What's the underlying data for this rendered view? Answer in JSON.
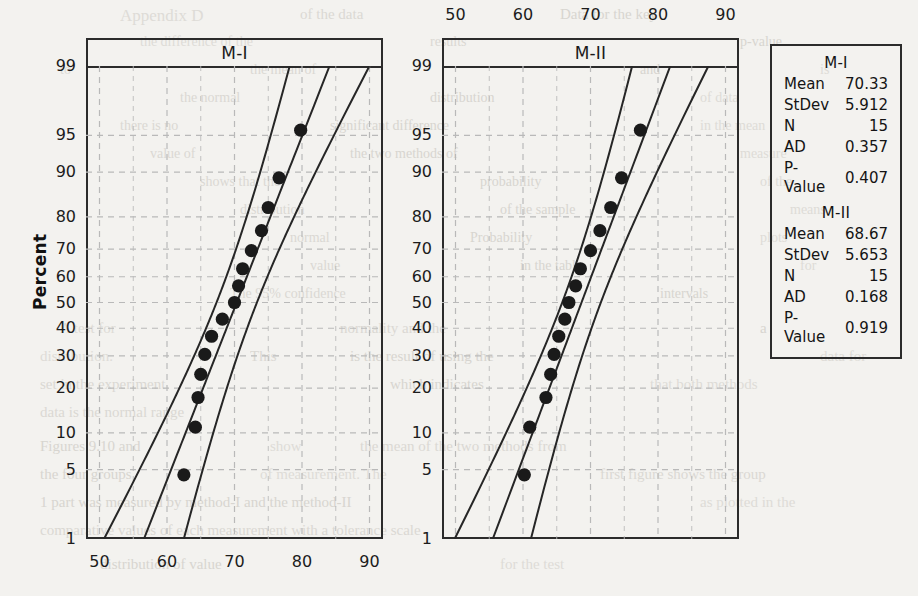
{
  "page": {
    "background_color": "#f3f2ef",
    "axis_color": "#2b2b2b",
    "grid_color": "#b9b9b9",
    "point_color": "#1a1a1a"
  },
  "axis": {
    "y_title": "Percent",
    "y_ticks": [
      "99",
      "95",
      "90",
      "80",
      "70",
      "60",
      "50",
      "40",
      "30",
      "20",
      "10",
      "5",
      "1"
    ],
    "x_ticks": [
      "50",
      "60",
      "70",
      "80",
      "90"
    ]
  },
  "panels": [
    {
      "id": "m1",
      "title": "M-I",
      "x_label_position": "bottom"
    },
    {
      "id": "m2",
      "title": "M-II",
      "x_label_position": "top"
    }
  ],
  "stats": {
    "groups": [
      {
        "name": "M-I",
        "rows": [
          {
            "label": "Mean",
            "value": "70.33"
          },
          {
            "label": "StDev",
            "value": "5.912"
          },
          {
            "label": "N",
            "value": "15"
          },
          {
            "label": "AD",
            "value": "0.357"
          },
          {
            "label": "P-Value",
            "value": "0.407"
          }
        ]
      },
      {
        "name": "M-II",
        "rows": [
          {
            "label": "Mean",
            "value": "68.67"
          },
          {
            "label": "StDev",
            "value": "5.653"
          },
          {
            "label": "N",
            "value": "15"
          },
          {
            "label": "AD",
            "value": "0.168"
          },
          {
            "label": "P-Value",
            "value": "0.919"
          }
        ]
      }
    ]
  },
  "chart_data": [
    {
      "type": "scatter",
      "title": "M-I",
      "subtitle": "Normal probability plot with 95% confidence bands",
      "xlabel": "",
      "ylabel": "Percent",
      "xlim": [
        48,
        92
      ],
      "ylim_percent": [
        1,
        99
      ],
      "grid": true,
      "x_ticks": [
        50,
        60,
        70,
        80,
        90
      ],
      "y_ticks_percent": [
        1,
        5,
        10,
        20,
        30,
        40,
        50,
        60,
        70,
        80,
        90,
        95,
        99
      ],
      "n": 15,
      "mean": 70.33,
      "stdev": 5.912,
      "ad": 0.357,
      "p_value": 0.407,
      "points": [
        {
          "x": 62.5,
          "percent": 4.5
        },
        {
          "x": 64.2,
          "percent": 11.0
        },
        {
          "x": 64.6,
          "percent": 17.5
        },
        {
          "x": 65.0,
          "percent": 24.0
        },
        {
          "x": 65.6,
          "percent": 30.5
        },
        {
          "x": 66.6,
          "percent": 37.0
        },
        {
          "x": 68.2,
          "percent": 43.5
        },
        {
          "x": 70.0,
          "percent": 50.0
        },
        {
          "x": 70.6,
          "percent": 56.5
        },
        {
          "x": 71.2,
          "percent": 63.0
        },
        {
          "x": 72.5,
          "percent": 69.5
        },
        {
          "x": 74.0,
          "percent": 76.0
        },
        {
          "x": 75.0,
          "percent": 82.5
        },
        {
          "x": 76.6,
          "percent": 89.0
        },
        {
          "x": 79.8,
          "percent": 95.5
        }
      ],
      "fit_line": {
        "slope_mean": 70.33,
        "stdev": 5.912
      },
      "confidence_bands": 95
    },
    {
      "type": "scatter",
      "title": "M-II",
      "subtitle": "Normal probability plot with 95% confidence bands",
      "xlabel": "",
      "ylabel": "Percent",
      "xlim": [
        48,
        92
      ],
      "ylim_percent": [
        1,
        99
      ],
      "grid": true,
      "x_ticks": [
        50,
        60,
        70,
        80,
        90
      ],
      "y_ticks_percent": [
        1,
        5,
        10,
        20,
        30,
        40,
        50,
        60,
        70,
        80,
        90,
        95,
        99
      ],
      "n": 15,
      "mean": 68.67,
      "stdev": 5.653,
      "ad": 0.168,
      "p_value": 0.919,
      "points": [
        {
          "x": 60.2,
          "percent": 4.5
        },
        {
          "x": 61.0,
          "percent": 11.0
        },
        {
          "x": 63.4,
          "percent": 17.5
        },
        {
          "x": 64.1,
          "percent": 24.0
        },
        {
          "x": 64.6,
          "percent": 30.5
        },
        {
          "x": 65.3,
          "percent": 37.0
        },
        {
          "x": 66.2,
          "percent": 43.5
        },
        {
          "x": 66.8,
          "percent": 50.0
        },
        {
          "x": 67.8,
          "percent": 56.5
        },
        {
          "x": 68.5,
          "percent": 63.0
        },
        {
          "x": 70.0,
          "percent": 69.5
        },
        {
          "x": 71.4,
          "percent": 76.0
        },
        {
          "x": 73.0,
          "percent": 82.5
        },
        {
          "x": 74.6,
          "percent": 89.0
        },
        {
          "x": 77.4,
          "percent": 95.5
        }
      ],
      "fit_line": {
        "slope_mean": 68.67,
        "stdev": 5.653
      },
      "confidence_bands": 95
    }
  ],
  "bleed_text": [
    {
      "t": "Appendix D",
      "x": 120,
      "y": 6,
      "s": 17
    },
    {
      "t": "of the data",
      "x": 300,
      "y": 6,
      "s": 15
    },
    {
      "t": "Data for the key",
      "x": 560,
      "y": 6,
      "s": 15
    },
    {
      "t": "the difference of the",
      "x": 140,
      "y": 34,
      "s": 14
    },
    {
      "t": "results",
      "x": 430,
      "y": 34,
      "s": 14
    },
    {
      "t": "p-value",
      "x": 740,
      "y": 34,
      "s": 14
    },
    {
      "t": "to",
      "x": 60,
      "y": 62,
      "s": 14
    },
    {
      "t": "the mean of",
      "x": 250,
      "y": 62,
      "s": 14
    },
    {
      "t": "and",
      "x": 640,
      "y": 62,
      "s": 14
    },
    {
      "t": "is",
      "x": 820,
      "y": 62,
      "s": 14
    },
    {
      "t": "the normal",
      "x": 180,
      "y": 90,
      "s": 14
    },
    {
      "t": "distribution",
      "x": 430,
      "y": 90,
      "s": 14
    },
    {
      "t": "of data",
      "x": 700,
      "y": 90,
      "s": 14
    },
    {
      "t": "there is no",
      "x": 120,
      "y": 118,
      "s": 14
    },
    {
      "t": "significant difference",
      "x": 330,
      "y": 118,
      "s": 14
    },
    {
      "t": "in the mean",
      "x": 700,
      "y": 118,
      "s": 14
    },
    {
      "t": "value of",
      "x": 150,
      "y": 146,
      "s": 14
    },
    {
      "t": "the two methods of",
      "x": 350,
      "y": 146,
      "s": 14
    },
    {
      "t": "measure",
      "x": 740,
      "y": 146,
      "s": 14
    },
    {
      "t": "shows that the",
      "x": 200,
      "y": 174,
      "s": 14
    },
    {
      "t": "probability",
      "x": 480,
      "y": 174,
      "s": 14
    },
    {
      "t": "of the",
      "x": 760,
      "y": 174,
      "s": 14
    },
    {
      "t": "distribution",
      "x": 240,
      "y": 202,
      "s": 14
    },
    {
      "t": "of the sample",
      "x": 500,
      "y": 202,
      "s": 14
    },
    {
      "t": "means",
      "x": 790,
      "y": 202,
      "s": 14
    },
    {
      "t": "normal",
      "x": 290,
      "y": 230,
      "s": 14
    },
    {
      "t": "Probability",
      "x": 470,
      "y": 230,
      "s": 14
    },
    {
      "t": "plots",
      "x": 760,
      "y": 230,
      "s": 14
    },
    {
      "t": "value",
      "x": 310,
      "y": 258,
      "s": 14
    },
    {
      "t": "in the table",
      "x": 520,
      "y": 258,
      "s": 14
    },
    {
      "t": "for",
      "x": 800,
      "y": 258,
      "s": 14
    },
    {
      "t": "The 95% confidence",
      "x": 230,
      "y": 286,
      "s": 14
    },
    {
      "t": "intervals",
      "x": 660,
      "y": 286,
      "s": 14
    },
    {
      "t": "A test for",
      "x": 60,
      "y": 320,
      "s": 15
    },
    {
      "t": "normality and the",
      "x": 340,
      "y": 320,
      "s": 15
    },
    {
      "t": "a",
      "x": 760,
      "y": 320,
      "s": 15
    },
    {
      "t": "distribution.",
      "x": 40,
      "y": 348,
      "s": 15
    },
    {
      "t": "This",
      "x": 250,
      "y": 348,
      "s": 15
    },
    {
      "t": "is the result of using the",
      "x": 350,
      "y": 348,
      "s": 15
    },
    {
      "t": "data for",
      "x": 820,
      "y": 348,
      "s": 15
    },
    {
      "t": "set in the experiment",
      "x": 40,
      "y": 376,
      "s": 15
    },
    {
      "t": "which indicates",
      "x": 390,
      "y": 376,
      "s": 15
    },
    {
      "t": "that both methods",
      "x": 650,
      "y": 376,
      "s": 15
    },
    {
      "t": "data is the normal range",
      "x": 40,
      "y": 404,
      "s": 15
    },
    {
      "t": "Figures 9.10 and",
      "x": 40,
      "y": 438,
      "s": 15
    },
    {
      "t": "show",
      "x": 270,
      "y": 438,
      "s": 15
    },
    {
      "t": "the mean of the two methods from",
      "x": 360,
      "y": 438,
      "s": 15
    },
    {
      "t": "the four groups",
      "x": 40,
      "y": 466,
      "s": 15
    },
    {
      "t": "of measurement. The",
      "x": 260,
      "y": 466,
      "s": 15
    },
    {
      "t": "first figure shows the group",
      "x": 600,
      "y": 466,
      "s": 15
    },
    {
      "t": "1 part was measured by method-I and the method-II",
      "x": 40,
      "y": 494,
      "s": 15
    },
    {
      "t": "as plotted in the",
      "x": 700,
      "y": 494,
      "s": 15
    },
    {
      "t": "comparative values of each measurement with a tolerance scale",
      "x": 40,
      "y": 522,
      "s": 15
    },
    {
      "t": "distribution of value",
      "x": 100,
      "y": 556,
      "s": 15
    },
    {
      "t": "for the test",
      "x": 500,
      "y": 556,
      "s": 15
    }
  ]
}
